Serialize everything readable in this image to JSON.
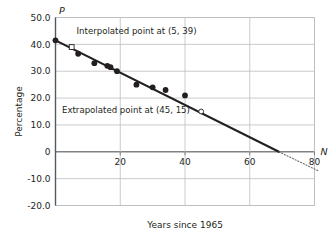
{
  "chart_data": {
    "type": "scatter",
    "title": "",
    "xlabel": "Years since 1965",
    "ylabel": "Percentage",
    "x_axis_letter": "N",
    "y_axis_letter": "P",
    "xlim": [
      0,
      80
    ],
    "ylim": [
      -20,
      50
    ],
    "grid": true,
    "legend": "none",
    "xticks": [
      20,
      40,
      60,
      80
    ],
    "xtick_labels": [
      "20",
      "40",
      "60",
      "80"
    ],
    "yticks": [
      50,
      40,
      30,
      20,
      10,
      0,
      -10,
      -20
    ],
    "ytick_labels": [
      "50.0",
      "40.0",
      "30.0",
      "20.0",
      "10.0",
      "0",
      "-10.0",
      "-20.0"
    ],
    "series": [
      {
        "name": "observed-data-points",
        "marker": "filled-circle",
        "points": [
          [
            0,
            41.5
          ],
          [
            7,
            36.5
          ],
          [
            12,
            33.0
          ],
          [
            16,
            32.0
          ],
          [
            17,
            31.5
          ],
          [
            19,
            30.0
          ],
          [
            25,
            25.0
          ],
          [
            30,
            24.0
          ],
          [
            34,
            23.0
          ],
          [
            40,
            21.0
          ]
        ]
      },
      {
        "name": "interpolated-point",
        "marker": "open-square",
        "points": [
          [
            5,
            39
          ]
        ]
      },
      {
        "name": "extrapolated-point",
        "marker": "open-circle",
        "points": [
          [
            45,
            15
          ]
        ]
      }
    ],
    "trend_line": {
      "name": "line-of-best-fit",
      "style": "solid",
      "from": [
        0,
        41.5
      ],
      "to": [
        69,
        0
      ]
    },
    "trend_line_extension": {
      "name": "dotted-extension",
      "style": "dotted",
      "from": [
        69,
        0
      ],
      "to": [
        81,
        -7
      ]
    },
    "annotations": [
      {
        "name": "interpolated-annotation",
        "text": "Interpolated point at (5, 39)",
        "x": 6.5,
        "y": 43.8
      },
      {
        "name": "extrapolated-annotation",
        "text": "Extrapolated point at (45, 15)",
        "x": 2.0,
        "y": 14.6
      }
    ],
    "colors": {
      "axis": "#58595b",
      "grid": "#bcbec0",
      "zero_axis": "#808285",
      "marker": "#231f20",
      "line": "#231f20",
      "text": "#231f20",
      "background": "#ffffff"
    }
  }
}
